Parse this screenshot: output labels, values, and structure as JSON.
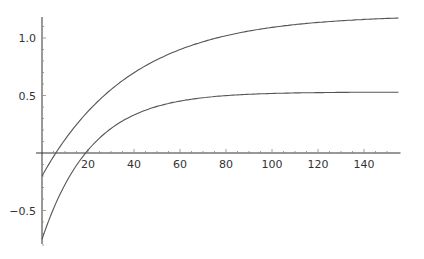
{
  "chart_data": {
    "type": "line",
    "title": "",
    "xlabel": "",
    "ylabel": "",
    "xlim": [
      0,
      155
    ],
    "ylim": [
      -0.8,
      1.2
    ],
    "grid": false,
    "legend": null,
    "x_ticks": [
      20,
      40,
      60,
      80,
      100,
      120,
      140
    ],
    "x_tick_labels": [
      "20",
      "40",
      "60",
      "80",
      "100",
      "120",
      "140"
    ],
    "y_ticks": [
      -0.5,
      0.5,
      1.0
    ],
    "y_tick_labels": [
      "-0.5",
      "0.5",
      "1.0"
    ],
    "series": [
      {
        "name": "upper curve",
        "color": "#555555",
        "model": {
          "A": 1.2,
          "B": 1.4,
          "tau": 39
        },
        "x": [
          0,
          6,
          20,
          40,
          60,
          80,
          100,
          120,
          140,
          155
        ],
        "values": [
          -0.2,
          0.0,
          0.36,
          0.7,
          0.9,
          1.02,
          1.09,
          1.14,
          1.16,
          1.17
        ]
      },
      {
        "name": "lower curve",
        "color": "#555555",
        "model": {
          "A": 0.53,
          "B": 1.28,
          "tau": 21.5
        },
        "x": [
          0,
          10,
          19,
          20,
          40,
          60,
          80,
          100,
          120,
          140,
          155
        ],
        "values": [
          -0.75,
          -0.27,
          0.0,
          0.02,
          0.33,
          0.45,
          0.5,
          0.52,
          0.53,
          0.53,
          0.53
        ]
      }
    ]
  }
}
